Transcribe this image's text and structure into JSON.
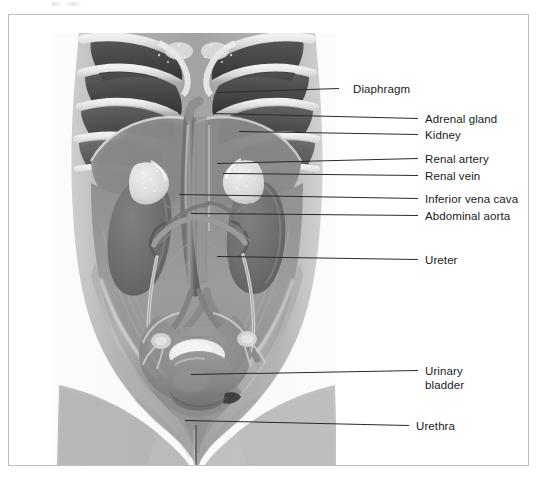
{
  "figure": {
    "view": "anterior",
    "style": "grayscale medical illustration",
    "frame_color": "#bdbdbd",
    "leader_color": "#2b2b2b",
    "label_color": "#1a1a1a"
  },
  "labels": [
    {
      "id": "diaphragm",
      "text": "Diaphragm",
      "x": 352,
      "y": 82,
      "leader": {
        "x1": 338,
        "y1": 88,
        "x2": 216,
        "y2": 92
      }
    },
    {
      "id": "adrenal-gland",
      "text": "Adrenal gland",
      "x": 424,
      "y": 112,
      "leader": {
        "x1": 417,
        "y1": 118,
        "x2": 213,
        "y2": 113
      }
    },
    {
      "id": "kidney",
      "text": "Kidney",
      "x": 424,
      "y": 128,
      "leader": {
        "x1": 417,
        "y1": 134,
        "x2": 238,
        "y2": 131
      }
    },
    {
      "id": "renal-artery",
      "text": "Renal artery",
      "x": 424,
      "y": 152,
      "leader": {
        "x1": 417,
        "y1": 158,
        "x2": 216,
        "y2": 163
      }
    },
    {
      "id": "renal-vein",
      "text": "Renal vein",
      "x": 424,
      "y": 169,
      "leader": {
        "x1": 417,
        "y1": 175,
        "x2": 222,
        "y2": 173
      }
    },
    {
      "id": "inferior-vena-cava",
      "text": "Inferior vena cava",
      "x": 424,
      "y": 192,
      "leader": {
        "x1": 417,
        "y1": 198,
        "x2": 178,
        "y2": 194
      }
    },
    {
      "id": "abdominal-aorta",
      "text": "Abdominal aorta",
      "x": 424,
      "y": 209,
      "leader": {
        "x1": 417,
        "y1": 215,
        "x2": 190,
        "y2": 213
      }
    },
    {
      "id": "ureter",
      "text": "Ureter",
      "x": 424,
      "y": 253,
      "leader": {
        "x1": 417,
        "y1": 259,
        "x2": 216,
        "y2": 256
      }
    },
    {
      "id": "urinary-bladder",
      "text": "Urinary\nbladder",
      "x": 424,
      "y": 364,
      "leader": {
        "x1": 417,
        "y1": 370,
        "x2": 190,
        "y2": 374
      }
    },
    {
      "id": "urethra",
      "text": "Urethra",
      "x": 415,
      "y": 419,
      "leader": {
        "x1": 408,
        "y1": 425,
        "x2": 184,
        "y2": 420
      }
    }
  ],
  "structures": [
    {
      "id": "ribcage",
      "name": "Rib cage and costal cartilage"
    },
    {
      "id": "diaphragm",
      "name": "Diaphragm"
    },
    {
      "id": "liver-shadow",
      "name": "Liver outline (right upper quadrant)"
    },
    {
      "id": "adrenal-left",
      "name": "Left adrenal gland"
    },
    {
      "id": "adrenal-right",
      "name": "Right adrenal gland"
    },
    {
      "id": "kidney-left",
      "name": "Left kidney"
    },
    {
      "id": "kidney-right",
      "name": "Right kidney"
    },
    {
      "id": "aorta",
      "name": "Abdominal aorta"
    },
    {
      "id": "vena-cava",
      "name": "Inferior vena cava"
    },
    {
      "id": "renal-vessels",
      "name": "Renal arteries and veins"
    },
    {
      "id": "ureter-left",
      "name": "Left ureter"
    },
    {
      "id": "ureter-right",
      "name": "Right ureter"
    },
    {
      "id": "psoas",
      "name": "Psoas major muscles"
    },
    {
      "id": "pelvis",
      "name": "Bony pelvis and sacrum"
    },
    {
      "id": "bladder",
      "name": "Urinary bladder"
    },
    {
      "id": "urethra",
      "name": "Urethra"
    },
    {
      "id": "thighs",
      "name": "Upper thighs"
    }
  ]
}
